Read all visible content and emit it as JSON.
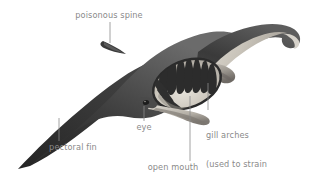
{
  "figure": {
    "name": "manta-ray-anatomy-diagram",
    "background_color": "#ffffff",
    "label_color": "#8a8a8a",
    "leader_line_color": "#8a8a8a",
    "body_dark_color": "#3b3b3b",
    "body_mid_color": "#5c5c5c",
    "body_light_color": "#cfcac2",
    "mouth_cavity_color": "#d8d4cb",
    "gill_color": "#2e2e2e"
  },
  "labels": {
    "poisonous_spine": "poisonous spine",
    "pectoral_fin": "pectoral fin",
    "eye": "eye",
    "open_mouth": "open mouth",
    "gill_arches_line1": "gill arches",
    "gill_arches_line2": "(used to strain",
    "gill_arches_line3": "plankton)"
  }
}
